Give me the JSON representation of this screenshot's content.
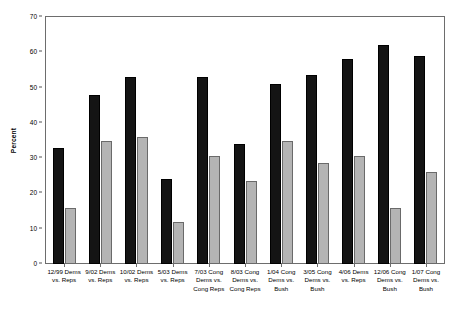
{
  "chart_data": {
    "type": "bar",
    "title": "",
    "subtitle": "",
    "xlabel": "",
    "ylabel": "Percent",
    "ylim": [
      0,
      70
    ],
    "ytick_step": 10,
    "yticks": [
      0,
      10,
      20,
      30,
      40,
      50,
      60,
      70
    ],
    "grid": false,
    "legend": "none",
    "categories": [
      "12/99 Dems vs. Reps",
      "9/02 Dems vs. Reps",
      "10/02 Dems vs. Reps",
      "5/03 Dems vs. Reps",
      "7/03 Cong Dems vs. Cong Reps",
      "8/03 Cong Dems vs. Cong Reps",
      "1/04 Cong Dems vs. Bush",
      "3/05 Cong Dems vs. Bush",
      "4/06 Dems vs. Reps",
      "12/06 Cong Dems vs. Bush",
      "1/07 Cong Dems vs. Bush"
    ],
    "series": [
      {
        "name": "series-1-dark",
        "color": "#141414",
        "values": [
          33,
          48,
          53,
          24,
          53,
          34,
          51,
          53.5,
          58,
          62,
          59
        ]
      },
      {
        "name": "series-2-light",
        "color": "#b4b4b4",
        "values": [
          16,
          35,
          36,
          12,
          30.5,
          23.5,
          35,
          28.5,
          30.5,
          16,
          26
        ]
      }
    ]
  },
  "axis": {
    "y_title": "Percent",
    "tick_labels": [
      "70",
      "60",
      "50",
      "40",
      "30",
      "20",
      "10",
      "0"
    ]
  }
}
